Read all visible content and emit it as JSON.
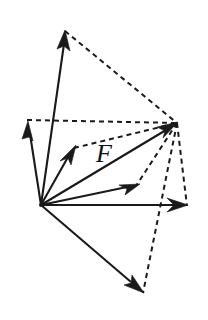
{
  "figure": {
    "type": "vector-diagram",
    "canvas": {
      "width": 208,
      "height": 320,
      "background": "#ffffff"
    },
    "stroke_color": "#1a1a1a",
    "label_color": "#111111",
    "origin": {
      "name": "origin",
      "x": 41,
      "y": 205
    },
    "resultant_point": {
      "name": "resultant-tip",
      "x": 177,
      "y": 123
    },
    "labels": [
      {
        "id": "force-label-F",
        "text": "F",
        "x": 104,
        "y": 162,
        "font_size": 26,
        "style": "italic-serif"
      }
    ],
    "solid_vectors": [
      {
        "id": "vector-up-tall",
        "name": "component-vector-up",
        "x1": 41,
        "y1": 205,
        "x2": 65,
        "y2": 31,
        "head_size": 13
      },
      {
        "id": "vector-up-left",
        "name": "component-vector-upper-left",
        "x1": 41,
        "y1": 205,
        "x2": 28,
        "y2": 122,
        "head_size": 12
      },
      {
        "id": "vector-diagonal-short",
        "name": "component-vector-diagonal",
        "x1": 41,
        "y1": 205,
        "x2": 75,
        "y2": 147,
        "head_size": 12
      },
      {
        "id": "vector-resultant",
        "name": "resultant-vector-F",
        "x1": 41,
        "y1": 205,
        "x2": 177,
        "y2": 123,
        "head_size": 13
      },
      {
        "id": "vector-mid-right",
        "name": "component-vector-mid-right",
        "x1": 41,
        "y1": 205,
        "x2": 139,
        "y2": 185,
        "head_size": 13
      },
      {
        "id": "vector-horizontal",
        "name": "component-vector-horizontal",
        "x1": 41,
        "y1": 205,
        "x2": 187,
        "y2": 205,
        "head_size": 13
      },
      {
        "id": "vector-down-right",
        "name": "component-vector-down-right",
        "x1": 41,
        "y1": 205,
        "x2": 143,
        "y2": 292,
        "head_size": 13
      }
    ],
    "dashed_lines": [
      {
        "id": "dash-top-to-resultant",
        "name": "construction-line-top",
        "x1": 65,
        "y1": 31,
        "x2": 177,
        "y2": 123
      },
      {
        "id": "dash-left-to-resultant",
        "name": "construction-line-horizontal-upper",
        "x1": 27,
        "y1": 120,
        "x2": 177,
        "y2": 123
      },
      {
        "id": "dash-diagonal-to-resultant",
        "name": "construction-line-diagonal",
        "x1": 74,
        "y1": 148,
        "x2": 177,
        "y2": 123
      },
      {
        "id": "dash-resultant-to-mid",
        "name": "construction-line-mid-right",
        "x1": 177,
        "y1": 123,
        "x2": 136,
        "y2": 186
      },
      {
        "id": "dash-resultant-to-horizontal-tip",
        "name": "construction-line-right-edge",
        "x1": 177,
        "y1": 123,
        "x2": 187,
        "y2": 206
      },
      {
        "id": "dash-resultant-to-bottom",
        "name": "construction-line-bottom",
        "x1": 177,
        "y1": 123,
        "x2": 143,
        "y2": 293
      }
    ]
  }
}
